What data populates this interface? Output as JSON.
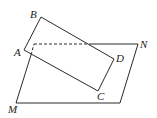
{
  "diagram": {
    "type": "geometry-figure",
    "labels": {
      "A": "A",
      "B": "B",
      "C": "C",
      "D": "D",
      "M": "M",
      "N": "N"
    },
    "colors": {
      "line": "#2a2a2a",
      "background": "#ffffff"
    }
  }
}
